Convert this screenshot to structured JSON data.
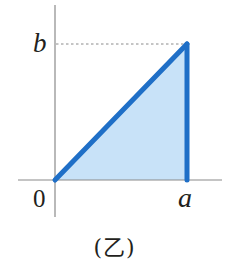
{
  "figure": {
    "caption": "(乙)",
    "labels": {
      "origin": "0",
      "x_point": "a",
      "y_point": "b"
    },
    "colors": {
      "axis": "#8a8a8a",
      "triangle_stroke": "#1f6fc7",
      "triangle_fill": "#c8e2f8",
      "dashed_guide": "#8a8a8a",
      "text": "#231f20"
    },
    "shape": {
      "type": "right-triangle",
      "vertices": [
        {
          "name": "origin",
          "x": "0",
          "y": "0"
        },
        {
          "name": "top",
          "x": "a",
          "y": "b"
        },
        {
          "name": "bottom-right",
          "x": "a",
          "y": "0"
        }
      ],
      "guide": "dashed horizontal line from y-axis at b to vertex (a, b)"
    }
  }
}
